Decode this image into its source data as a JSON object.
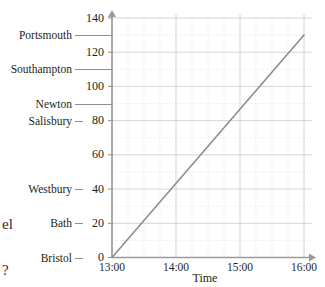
{
  "chart_data": {
    "type": "line",
    "title": "",
    "xlabel": "Time",
    "ylabel": "",
    "grid": true,
    "legend": "none",
    "xlim": [
      "13:00",
      "16:00"
    ],
    "ylim": [
      0,
      140
    ],
    "x_ticks": [
      "13:00",
      "14:00",
      "15:00",
      "16:00"
    ],
    "y_ticks": [
      0,
      20,
      40,
      60,
      80,
      100,
      120,
      140
    ],
    "y_minor_step": 10,
    "y_place_labels": [
      {
        "name": "Bristol",
        "value": 0
      },
      {
        "name": "Bath",
        "value": 20
      },
      {
        "name": "Westbury",
        "value": 40
      },
      {
        "name": "Salisbury",
        "value": 80
      },
      {
        "name": "Newton",
        "value": 90
      },
      {
        "name": "Southampton",
        "value": 110
      },
      {
        "name": "Portsmouth",
        "value": 130
      }
    ],
    "series": [
      {
        "name": "journey",
        "points": [
          {
            "x": "13:00",
            "y": 0
          },
          {
            "x": "16:00",
            "y": 130
          }
        ]
      }
    ],
    "axis_arrows": {
      "x": "right",
      "y": "up"
    },
    "colors": {
      "line": "#8a8a8a",
      "axis": "#8d8d8d",
      "grid_major": "#c9c9c9",
      "grid_minor": "#d8d8d8",
      "text": "#231f20",
      "background": "#ffffff"
    }
  },
  "page_fragments": {
    "left_middle": "el",
    "left_bottom": "?"
  }
}
